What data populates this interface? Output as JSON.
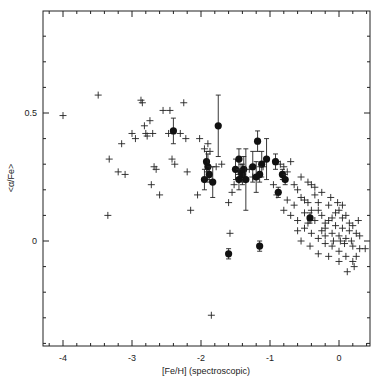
{
  "chart_data": {
    "type": "scatter",
    "title": "",
    "xlabel": "[Fe/H] (spectroscopic)",
    "ylabel": "<α/Fe>",
    "xlim": [
      -4.3,
      0.45
    ],
    "ylim": [
      -0.41,
      0.9
    ],
    "grid": false,
    "legend": null,
    "x_ticks": {
      "major": [
        -4,
        -3,
        -2,
        -1,
        0
      ],
      "minor_step": 0.2,
      "labels": [
        "-4",
        "-3",
        "-2",
        "-1",
        "0"
      ]
    },
    "y_ticks": {
      "major": [
        0,
        0.5
      ],
      "minor_step": 0.1,
      "labels": [
        "0",
        "0.5"
      ]
    },
    "series": [
      {
        "name": "field stars",
        "marker": "plus",
        "points": [
          [
            -4.0,
            0.49
          ],
          [
            -3.49,
            0.57
          ],
          [
            -3.35,
            0.1
          ],
          [
            -3.33,
            0.32
          ],
          [
            -3.2,
            0.27
          ],
          [
            -3.15,
            0.38
          ],
          [
            -3.1,
            0.26
          ],
          [
            -3.0,
            0.42
          ],
          [
            -2.95,
            0.4
          ],
          [
            -2.87,
            0.55
          ],
          [
            -2.85,
            0.54
          ],
          [
            -2.82,
            0.45
          ],
          [
            -2.8,
            0.42
          ],
          [
            -2.78,
            0.41
          ],
          [
            -2.74,
            0.47
          ],
          [
            -2.72,
            0.22
          ],
          [
            -2.7,
            0.42
          ],
          [
            -2.68,
            0.29
          ],
          [
            -2.65,
            0.28
          ],
          [
            -2.6,
            0.18
          ],
          [
            -2.55,
            0.51
          ],
          [
            -2.45,
            0.51
          ],
          [
            -2.47,
            0.42
          ],
          [
            -2.42,
            0.32
          ],
          [
            -2.38,
            0.3
          ],
          [
            -2.3,
            0.42
          ],
          [
            -2.25,
            0.54
          ],
          [
            -2.22,
            0.4
          ],
          [
            -2.2,
            0.27
          ],
          [
            -2.15,
            0.12
          ],
          [
            -2.05,
            0.18
          ],
          [
            -2.02,
            0.4
          ],
          [
            -1.95,
            0.36
          ],
          [
            -1.9,
            0.38
          ],
          [
            -1.87,
            0.35
          ],
          [
            -1.78,
            0.29
          ],
          [
            -1.7,
            0.3
          ],
          [
            -1.6,
            0.15
          ],
          [
            -1.55,
            0.19
          ],
          [
            -1.52,
            0.22
          ],
          [
            -1.45,
            0.26
          ],
          [
            -1.85,
            -0.29
          ],
          [
            -1.58,
            0.03
          ],
          [
            -1.3,
            0.28
          ],
          [
            -1.25,
            0.25
          ],
          [
            -1.1,
            0.29
          ],
          [
            -0.95,
            0.22
          ],
          [
            -0.9,
            0.31
          ],
          [
            -0.85,
            0.3
          ],
          [
            -0.8,
            0.29
          ],
          [
            -0.75,
            0.27
          ],
          [
            -0.7,
            0.31
          ],
          [
            -0.65,
            0.22
          ],
          [
            -0.6,
            0.2
          ],
          [
            -0.55,
            0.17
          ],
          [
            -0.5,
            0.16
          ],
          [
            -0.45,
            0.15
          ],
          [
            -0.4,
            0.22
          ],
          [
            -0.35,
            0.18
          ],
          [
            -0.3,
            0.12
          ],
          [
            -0.25,
            0.1
          ],
          [
            -0.2,
            0.05
          ],
          [
            -0.15,
            0.08
          ],
          [
            -0.1,
            0.03
          ],
          [
            -0.05,
            0.06
          ],
          [
            0.0,
            0.02
          ],
          [
            0.05,
            0.05
          ],
          [
            0.1,
            0.01
          ],
          [
            0.15,
            0.04
          ],
          [
            0.2,
            -0.02
          ],
          [
            0.25,
            -0.06
          ],
          [
            0.3,
            0.02
          ],
          [
            -0.8,
            0.12
          ],
          [
            -0.7,
            0.1
          ],
          [
            -0.6,
            0.08
          ],
          [
            -0.5,
            0.05
          ],
          [
            -0.4,
            0.03
          ],
          [
            -0.3,
            0.01
          ],
          [
            -0.2,
            -0.01
          ],
          [
            -0.1,
            -0.02
          ],
          [
            0.0,
            -0.04
          ],
          [
            0.1,
            -0.06
          ],
          [
            0.2,
            -0.08
          ],
          [
            -0.55,
            0.25
          ],
          [
            -0.45,
            0.23
          ],
          [
            -0.35,
            0.21
          ],
          [
            -0.25,
            0.19
          ],
          [
            -0.15,
            0.14
          ],
          [
            -0.05,
            0.11
          ],
          [
            0.05,
            0.09
          ],
          [
            0.15,
            0.07
          ],
          [
            0.25,
            0.03
          ],
          [
            -0.65,
            0.14
          ],
          [
            -0.5,
            0.11
          ],
          [
            -0.35,
            0.08
          ],
          [
            -0.2,
            0.07
          ],
          [
            -0.1,
            0.09
          ],
          [
            0.0,
            0.12
          ],
          [
            0.1,
            0.1
          ],
          [
            0.2,
            0.06
          ],
          [
            -0.3,
            -0.05
          ],
          [
            -0.15,
            -0.06
          ],
          [
            0.0,
            -0.08
          ],
          [
            0.12,
            -0.12
          ],
          [
            0.22,
            -0.1
          ],
          [
            -0.9,
            0.18
          ],
          [
            -0.75,
            0.16
          ],
          [
            -0.6,
            0.04
          ],
          [
            -0.45,
            0.07
          ],
          [
            -0.25,
            0.04
          ],
          [
            -0.08,
            0.0
          ],
          [
            0.08,
            -0.01
          ],
          [
            0.3,
            -0.03
          ],
          [
            0.38,
            -0.03
          ],
          [
            -0.02,
            0.15
          ],
          [
            -0.4,
            0.12
          ],
          [
            -0.12,
            0.17
          ],
          [
            0.05,
            0.14
          ],
          [
            -0.3,
            0.15
          ],
          [
            -0.55,
            0.0
          ],
          [
            -0.42,
            -0.02
          ],
          [
            -0.2,
            0.02
          ],
          [
            0.02,
            0.0
          ],
          [
            0.18,
            0.0
          ],
          [
            0.28,
            0.08
          ]
        ]
      },
      {
        "name": "globular clusters",
        "marker": "filled-circle",
        "points": [
          {
            "x": -2.4,
            "y": 0.43,
            "err": 0.05
          },
          {
            "x": -1.75,
            "y": 0.45,
            "err": 0.12
          },
          {
            "x": -1.92,
            "y": 0.31,
            "err": 0.04
          },
          {
            "x": -1.9,
            "y": 0.29,
            "err": 0.05
          },
          {
            "x": -1.88,
            "y": 0.26,
            "err": 0.03
          },
          {
            "x": -1.95,
            "y": 0.24,
            "err": 0.04
          },
          {
            "x": -1.83,
            "y": 0.23,
            "err": 0.06
          },
          {
            "x": -1.5,
            "y": 0.28,
            "err": 0.04
          },
          {
            "x": -1.45,
            "y": 0.32,
            "err": 0.04
          },
          {
            "x": -1.42,
            "y": 0.27,
            "err": 0.03
          },
          {
            "x": -1.4,
            "y": 0.26,
            "err": 0.04
          },
          {
            "x": -1.38,
            "y": 0.28,
            "err": 0.05
          },
          {
            "x": -1.45,
            "y": 0.24,
            "err": 0.04
          },
          {
            "x": -1.35,
            "y": 0.24,
            "err": 0.12
          },
          {
            "x": -1.25,
            "y": 0.29,
            "err": 0.06
          },
          {
            "x": -1.2,
            "y": 0.25,
            "err": 0.06
          },
          {
            "x": -1.18,
            "y": 0.39,
            "err": 0.04
          },
          {
            "x": -1.12,
            "y": 0.3,
            "err": 0.05
          },
          {
            "x": -1.05,
            "y": 0.32,
            "err": 0.08
          },
          {
            "x": -1.15,
            "y": 0.26,
            "err": 0.03
          },
          {
            "x": -0.92,
            "y": 0.31,
            "err": 0.03
          },
          {
            "x": -0.82,
            "y": 0.26,
            "err": 0.02
          },
          {
            "x": -0.78,
            "y": 0.24,
            "err": 0.02
          },
          {
            "x": -0.88,
            "y": 0.19,
            "err": 0.02
          },
          {
            "x": -0.42,
            "y": 0.09,
            "err": 0.02
          },
          {
            "x": -1.6,
            "y": -0.05,
            "err": 0.02
          },
          {
            "x": -1.15,
            "y": -0.02,
            "err": 0.02
          }
        ]
      }
    ]
  }
}
